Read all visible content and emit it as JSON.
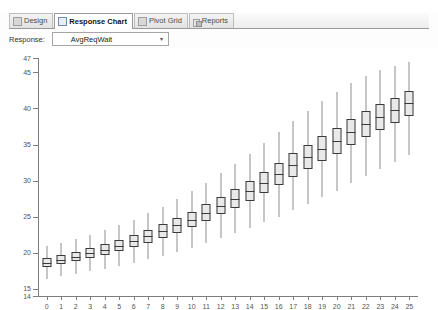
{
  "window": {
    "tabs": [
      {
        "label": "Design",
        "icon": "design-icon",
        "active": false
      },
      {
        "label": "Response Chart",
        "icon": "chart-icon",
        "active": true
      },
      {
        "label": "Pivot Grid",
        "icon": "grid-icon",
        "active": false
      },
      {
        "label": "Reports",
        "icon": "reports-icon",
        "active": false
      }
    ]
  },
  "controls": {
    "response_label": "Response:",
    "response_value": "AvgReqWait",
    "dropdown_arrow": "▾"
  },
  "colors": {
    "box_fill": "#e9e9e9",
    "box_stroke": "#3a3a3a",
    "whisker": "#8e8e8e",
    "axis": "#7d7d7d",
    "tab_active_bg": "#ffffff",
    "panel_bg": "#ffffff"
  },
  "chart_data": {
    "type": "boxplot",
    "title": "",
    "xlabel": "",
    "ylabel": "",
    "xlim": [
      -0.6,
      25.6
    ],
    "ylim": [
      14,
      47
    ],
    "grid": false,
    "legend": null,
    "yticks": [
      15,
      20,
      25,
      30,
      35,
      40,
      45,
      47
    ],
    "ytick_labels": [
      "15",
      "20",
      "25",
      "30",
      "35",
      "40",
      "45",
      "47"
    ],
    "y_axis_bottom_label": "14",
    "categories": [
      "0",
      "1",
      "2",
      "3",
      "4",
      "5",
      "6",
      "7",
      "8",
      "9",
      "10",
      "11",
      "12",
      "13",
      "14",
      "15",
      "16",
      "17",
      "18",
      "19",
      "20",
      "21",
      "22",
      "23",
      "24",
      "25"
    ],
    "boxes": [
      {
        "x": 0,
        "low": 16.4,
        "q1": 18.0,
        "med": 18.6,
        "q3": 19.2,
        "high": 21.0
      },
      {
        "x": 1,
        "low": 16.8,
        "q1": 18.4,
        "med": 19.0,
        "q3": 19.7,
        "high": 21.4
      },
      {
        "x": 2,
        "low": 17.1,
        "q1": 18.8,
        "med": 19.4,
        "q3": 20.1,
        "high": 21.9
      },
      {
        "x": 3,
        "low": 17.4,
        "q1": 19.2,
        "med": 19.9,
        "q3": 20.6,
        "high": 22.4
      },
      {
        "x": 4,
        "low": 17.8,
        "q1": 19.7,
        "med": 20.4,
        "q3": 21.2,
        "high": 23.1
      },
      {
        "x": 5,
        "low": 18.2,
        "q1": 20.2,
        "med": 21.0,
        "q3": 21.8,
        "high": 23.8
      },
      {
        "x": 6,
        "low": 18.6,
        "q1": 20.8,
        "med": 21.6,
        "q3": 22.5,
        "high": 24.6
      },
      {
        "x": 7,
        "low": 19.1,
        "q1": 21.4,
        "med": 22.3,
        "q3": 23.2,
        "high": 25.5
      },
      {
        "x": 8,
        "low": 19.6,
        "q1": 22.1,
        "med": 23.0,
        "q3": 24.0,
        "high": 26.4
      },
      {
        "x": 9,
        "low": 20.1,
        "q1": 22.8,
        "med": 23.8,
        "q3": 24.8,
        "high": 27.4
      },
      {
        "x": 10,
        "low": 20.7,
        "q1": 23.6,
        "med": 24.6,
        "q3": 25.7,
        "high": 28.5
      },
      {
        "x": 11,
        "low": 21.3,
        "q1": 24.4,
        "med": 25.5,
        "q3": 26.7,
        "high": 29.7
      },
      {
        "x": 12,
        "low": 22.0,
        "q1": 25.3,
        "med": 26.5,
        "q3": 27.7,
        "high": 31.0
      },
      {
        "x": 13,
        "low": 22.7,
        "q1": 26.2,
        "med": 27.5,
        "q3": 28.8,
        "high": 32.3
      },
      {
        "x": 14,
        "low": 23.4,
        "q1": 27.2,
        "med": 28.6,
        "q3": 30.0,
        "high": 33.7
      },
      {
        "x": 15,
        "low": 24.2,
        "q1": 28.3,
        "med": 29.7,
        "q3": 31.2,
        "high": 35.2
      },
      {
        "x": 16,
        "low": 25.0,
        "q1": 29.4,
        "med": 30.9,
        "q3": 32.5,
        "high": 36.7
      },
      {
        "x": 17,
        "low": 25.9,
        "q1": 30.5,
        "med": 32.1,
        "q3": 33.8,
        "high": 38.2
      },
      {
        "x": 18,
        "low": 26.8,
        "q1": 31.6,
        "med": 33.3,
        "q3": 35.0,
        "high": 39.6
      },
      {
        "x": 19,
        "low": 27.7,
        "q1": 32.7,
        "med": 34.4,
        "q3": 36.2,
        "high": 41.0
      },
      {
        "x": 20,
        "low": 28.6,
        "q1": 33.7,
        "med": 35.5,
        "q3": 37.3,
        "high": 42.3
      },
      {
        "x": 21,
        "low": 29.6,
        "q1": 34.9,
        "med": 36.7,
        "q3": 38.5,
        "high": 43.5
      },
      {
        "x": 22,
        "low": 30.6,
        "q1": 36.0,
        "med": 37.8,
        "q3": 39.6,
        "high": 44.5
      },
      {
        "x": 23,
        "low": 31.6,
        "q1": 37.0,
        "med": 38.8,
        "q3": 40.6,
        "high": 45.3
      },
      {
        "x": 24,
        "low": 32.6,
        "q1": 38.0,
        "med": 39.8,
        "q3": 41.5,
        "high": 45.9
      },
      {
        "x": 25,
        "low": 33.6,
        "q1": 38.9,
        "med": 40.7,
        "q3": 42.4,
        "high": 46.4
      }
    ]
  }
}
